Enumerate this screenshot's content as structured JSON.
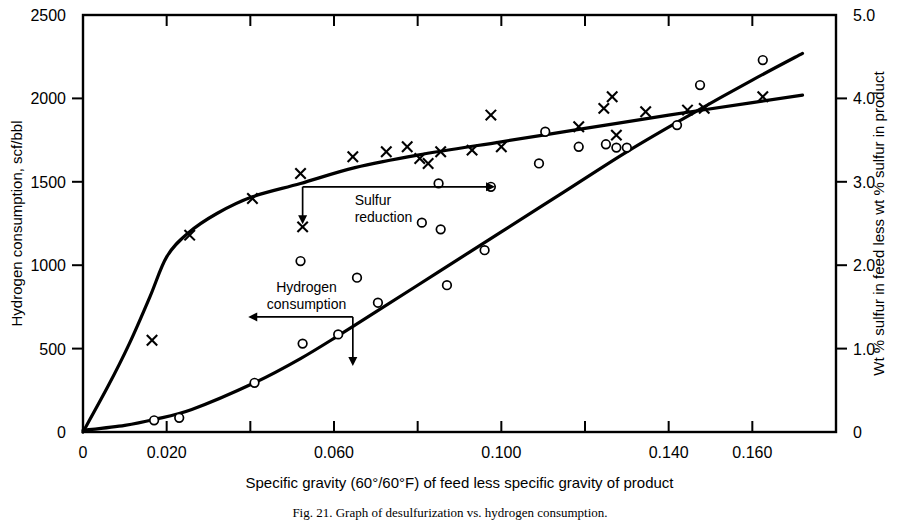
{
  "figure": {
    "caption": "Fig. 21.   Graph of desulfurization vs. hydrogen consumption.",
    "background": "#ffffff",
    "ink": "#000000"
  },
  "axes": {
    "left": {
      "title": "Hydrogen consumption, scf/bbl",
      "min": 0,
      "max": 2500,
      "tick_step": 500,
      "ticks": [
        0,
        500,
        1000,
        1500,
        2000,
        2500
      ],
      "tick_labels": [
        "0",
        "500",
        "1000",
        "1500",
        "2000",
        "2500"
      ]
    },
    "right": {
      "title": "Wt % sulfur in feed less wt % sulfur in product",
      "min": 0,
      "max": 5.0,
      "tick_step": 1.0,
      "ticks": [
        0,
        1.0,
        2.0,
        3.0,
        4.0,
        5.0
      ],
      "tick_labels": [
        "0",
        "1.0",
        "2.0",
        "3.0",
        "4.0",
        "5.0"
      ]
    },
    "bottom": {
      "title": "Specific gravity (60°/60°F) of feed less specific gravity of product",
      "min": 0,
      "max": 0.18,
      "tick_step": 0.02,
      "ticks": [
        0,
        0.02,
        0.04,
        0.06,
        0.08,
        0.1,
        0.12,
        0.14,
        0.16,
        0.18
      ],
      "labeled_ticks": [
        0,
        0.02,
        0.06,
        0.1,
        0.14,
        0.16
      ],
      "tick_labels": [
        "0",
        "0.020",
        "0.060",
        "0.100",
        "0.140",
        "0.160"
      ]
    },
    "grid": false,
    "frame": "box"
  },
  "annotations": [
    {
      "id": "sulfur-reduction",
      "text_line1": "Sulfur",
      "text_line2": "reduction",
      "anchor_x": 0.0525,
      "anchor_y_left": 1470,
      "arrow_right_to_x": 0.0985,
      "arrow_down_to_y_left": 1245
    },
    {
      "id": "hydrogen-consumption",
      "text_line1": "Hydrogen",
      "text_line2": "consumption",
      "anchor_x": 0.0645,
      "anchor_y_left": 690,
      "arrow_left_to_x": 0.0395,
      "arrow_down_to_y_left": 395
    }
  ],
  "chart_data": {
    "type": "scatter",
    "title": "",
    "xlabel": "Specific gravity (60°/60°F) of feed less specific gravity of product",
    "ylabel": "Hydrogen consumption, scf/bbl",
    "ylabel_secondary": "Wt % sulfur in feed less wt % sulfur in product",
    "xlim": [
      0,
      0.18
    ],
    "ylim": [
      0,
      2500
    ],
    "ylim_secondary": [
      0,
      5.0
    ],
    "grid": false,
    "legend": "none",
    "series": [
      {
        "name": "Sulfur reduction",
        "marker": "x",
        "axis": "right",
        "units": "wt % sulfur in feed less wt % sulfur in product",
        "points": [
          {
            "x": 0.0165,
            "y": 1.1
          },
          {
            "x": 0.0255,
            "y": 2.36
          },
          {
            "x": 0.0405,
            "y": 2.8
          },
          {
            "x": 0.052,
            "y": 3.1
          },
          {
            "x": 0.0525,
            "y": 2.46
          },
          {
            "x": 0.0645,
            "y": 3.3
          },
          {
            "x": 0.0725,
            "y": 3.36
          },
          {
            "x": 0.0775,
            "y": 3.42
          },
          {
            "x": 0.0805,
            "y": 3.28
          },
          {
            "x": 0.0825,
            "y": 3.22
          },
          {
            "x": 0.0855,
            "y": 3.36
          },
          {
            "x": 0.093,
            "y": 3.38
          },
          {
            "x": 0.0975,
            "y": 3.8
          },
          {
            "x": 0.1,
            "y": 3.42
          },
          {
            "x": 0.1185,
            "y": 3.66
          },
          {
            "x": 0.1245,
            "y": 3.88
          },
          {
            "x": 0.1265,
            "y": 4.02
          },
          {
            "x": 0.1275,
            "y": 3.56
          },
          {
            "x": 0.1345,
            "y": 3.84
          },
          {
            "x": 0.1445,
            "y": 3.86
          },
          {
            "x": 0.1485,
            "y": 3.88
          },
          {
            "x": 0.1625,
            "y": 4.02
          }
        ]
      },
      {
        "name": "Hydrogen consumption",
        "marker": "o",
        "axis": "left",
        "units": "scf/bbl",
        "points": [
          {
            "x": 0.017,
            "y": 70
          },
          {
            "x": 0.023,
            "y": 85
          },
          {
            "x": 0.041,
            "y": 295
          },
          {
            "x": 0.052,
            "y": 1025
          },
          {
            "x": 0.0525,
            "y": 530
          },
          {
            "x": 0.061,
            "y": 585
          },
          {
            "x": 0.0655,
            "y": 925
          },
          {
            "x": 0.0705,
            "y": 775
          },
          {
            "x": 0.081,
            "y": 1255
          },
          {
            "x": 0.085,
            "y": 1490
          },
          {
            "x": 0.0855,
            "y": 1215
          },
          {
            "x": 0.087,
            "y": 880
          },
          {
            "x": 0.096,
            "y": 1090
          },
          {
            "x": 0.0975,
            "y": 1470
          },
          {
            "x": 0.109,
            "y": 1610
          },
          {
            "x": 0.1105,
            "y": 1800
          },
          {
            "x": 0.1185,
            "y": 1710
          },
          {
            "x": 0.125,
            "y": 1725
          },
          {
            "x": 0.1275,
            "y": 1705
          },
          {
            "x": 0.13,
            "y": 1705
          },
          {
            "x": 0.142,
            "y": 1840
          },
          {
            "x": 0.1475,
            "y": 2080
          },
          {
            "x": 0.1625,
            "y": 2230
          }
        ]
      }
    ],
    "curves": [
      {
        "name": "Sulfur reduction trend",
        "axis": "right",
        "points": [
          {
            "x": 0.0,
            "y": 0.0
          },
          {
            "x": 0.006,
            "y": 0.55
          },
          {
            "x": 0.011,
            "y": 1.05
          },
          {
            "x": 0.016,
            "y": 1.62
          },
          {
            "x": 0.02,
            "y": 2.1
          },
          {
            "x": 0.025,
            "y": 2.38
          },
          {
            "x": 0.032,
            "y": 2.62
          },
          {
            "x": 0.0405,
            "y": 2.82
          },
          {
            "x": 0.052,
            "y": 2.98
          },
          {
            "x": 0.065,
            "y": 3.17
          },
          {
            "x": 0.08,
            "y": 3.32
          },
          {
            "x": 0.1,
            "y": 3.48
          },
          {
            "x": 0.12,
            "y": 3.64
          },
          {
            "x": 0.14,
            "y": 3.8
          },
          {
            "x": 0.16,
            "y": 3.95
          },
          {
            "x": 0.172,
            "y": 4.04
          }
        ]
      },
      {
        "name": "Hydrogen consumption trend",
        "axis": "left",
        "points": [
          {
            "x": 0.0,
            "y": 10
          },
          {
            "x": 0.01,
            "y": 40
          },
          {
            "x": 0.017,
            "y": 75
          },
          {
            "x": 0.026,
            "y": 135
          },
          {
            "x": 0.041,
            "y": 295
          },
          {
            "x": 0.052,
            "y": 440
          },
          {
            "x": 0.0615,
            "y": 585
          },
          {
            "x": 0.07,
            "y": 720
          },
          {
            "x": 0.085,
            "y": 960
          },
          {
            "x": 0.1,
            "y": 1200
          },
          {
            "x": 0.115,
            "y": 1440
          },
          {
            "x": 0.13,
            "y": 1680
          },
          {
            "x": 0.145,
            "y": 1900
          },
          {
            "x": 0.16,
            "y": 2110
          },
          {
            "x": 0.172,
            "y": 2270
          }
        ]
      }
    ]
  }
}
